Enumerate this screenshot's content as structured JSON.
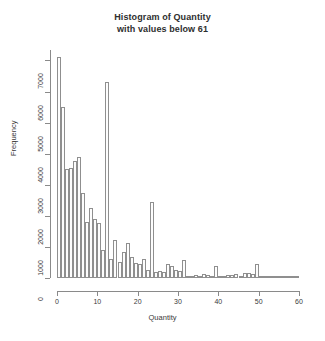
{
  "chart_data": {
    "type": "bar",
    "title": "Histogram of Quantity",
    "subtitle": "with values below 61",
    "xlabel": "Quantity",
    "ylabel": "Frequency",
    "xlim": [
      0,
      60
    ],
    "ylim": [
      0,
      7400
    ],
    "grid": false,
    "legend": null,
    "xticks": [
      0,
      10,
      20,
      30,
      40,
      50,
      60
    ],
    "yticks": [
      0,
      1000,
      2000,
      3000,
      4000,
      5000,
      6000,
      7000
    ],
    "xtick_labels": [
      "0",
      "10",
      "20",
      "30",
      "40",
      "50",
      "60"
    ],
    "ytick_labels": [
      "0",
      "1000",
      "2000",
      "3000",
      "4000",
      "5000",
      "6000",
      "7000"
    ],
    "bin_width": 1,
    "categories": [
      1,
      2,
      3,
      4,
      5,
      6,
      7,
      8,
      9,
      10,
      11,
      12,
      13,
      14,
      15,
      16,
      17,
      18,
      19,
      20,
      21,
      22,
      23,
      24,
      25,
      26,
      27,
      28,
      29,
      30,
      31,
      32,
      33,
      34,
      35,
      36,
      37,
      38,
      39,
      40,
      41,
      42,
      43,
      44,
      45,
      46,
      47,
      48,
      49,
      50,
      51,
      52,
      53,
      54,
      55,
      56,
      57,
      58,
      59,
      60
    ],
    "values": [
      7100,
      5500,
      3500,
      3550,
      3750,
      3900,
      2750,
      1800,
      2250,
      1900,
      1780,
      890,
      6300,
      600,
      1230,
      530,
      850,
      1130,
      690,
      480,
      460,
      610,
      250,
      2430,
      200,
      230,
      190,
      460,
      380,
      270,
      210,
      580,
      60,
      55,
      90,
      80,
      120,
      100,
      60,
      390,
      70,
      60,
      110,
      90,
      130,
      70,
      150,
      170,
      120,
      460,
      50,
      45,
      40,
      40,
      35,
      30,
      30,
      25,
      25,
      20
    ],
    "bar_centers": [
      1.5,
      2.5,
      3.5,
      4.5,
      5.5,
      6.5,
      7.5,
      8.5,
      9.5,
      10.5,
      11.5,
      12.5,
      13.5,
      14.5,
      15.5,
      16.5,
      17.5,
      18.5,
      19.5,
      20.5,
      21.5,
      22.5,
      23.5,
      24.5,
      25.5,
      26.5,
      27.5,
      28.5,
      29.5,
      30.5,
      31.5,
      32.5,
      33.5,
      34.5,
      35.5,
      36.5,
      37.5,
      38.5,
      39.5,
      40.5,
      41.5,
      42.5,
      43.5,
      44.5,
      45.5,
      46.5,
      47.5,
      48.5,
      49.5,
      50.5,
      51.5,
      52.5,
      53.5,
      54.5,
      55.5,
      56.5,
      57.5,
      58.5,
      59.5,
      60.5
    ],
    "bar_x_values": [
      1,
      2,
      3,
      4,
      5,
      6,
      7,
      8,
      9,
      10,
      11,
      12,
      13,
      14,
      15,
      16,
      17,
      18,
      19,
      20,
      21,
      22,
      23,
      24,
      25,
      26,
      27,
      28,
      29,
      30,
      31,
      32,
      33,
      34,
      35,
      36,
      37,
      38,
      39,
      40,
      41,
      42,
      43,
      44,
      45,
      46,
      47,
      48,
      49,
      50,
      51,
      52,
      53,
      54,
      55,
      56,
      57,
      58,
      59,
      60
    ],
    "bar_heights_ordered": [
      {
        "x": 1,
        "y": 7100
      },
      {
        "x": 2,
        "y": 5500
      },
      {
        "x": 3,
        "y": 3500
      },
      {
        "x": 4,
        "y": 3550
      },
      {
        "x": 5,
        "y": 3750
      },
      {
        "x": 6,
        "y": 3900
      },
      {
        "x": 7,
        "y": 2750
      },
      {
        "x": 8,
        "y": 1800
      },
      {
        "x": 9,
        "y": 2250
      },
      {
        "x": 10,
        "y": 1900
      },
      {
        "x": 11,
        "y": 1780
      },
      {
        "x": 12,
        "y": 890
      },
      {
        "x": 13,
        "y": 6300
      },
      {
        "x": 14,
        "y": 600
      },
      {
        "x": 15,
        "y": 1230
      },
      {
        "x": 16,
        "y": 530
      },
      {
        "x": 17,
        "y": 850
      },
      {
        "x": 18,
        "y": 1130
      },
      {
        "x": 19,
        "y": 690
      },
      {
        "x": 20,
        "y": 480
      },
      {
        "x": 21,
        "y": 460
      },
      {
        "x": 22,
        "y": 610
      },
      {
        "x": 23,
        "y": 250
      },
      {
        "x": 24,
        "y": 2430
      },
      {
        "x": 25,
        "y": 200
      },
      {
        "x": 26,
        "y": 230
      },
      {
        "x": 27,
        "y": 190
      },
      {
        "x": 28,
        "y": 460
      },
      {
        "x": 29,
        "y": 380
      },
      {
        "x": 30,
        "y": 270
      },
      {
        "x": 31,
        "y": 210
      },
      {
        "x": 32,
        "y": 580
      },
      {
        "x": 33,
        "y": 60
      },
      {
        "x": 34,
        "y": 55
      },
      {
        "x": 35,
        "y": 90
      },
      {
        "x": 36,
        "y": 80
      },
      {
        "x": 37,
        "y": 120
      },
      {
        "x": 38,
        "y": 100
      },
      {
        "x": 39,
        "y": 60
      },
      {
        "x": 40,
        "y": 390
      },
      {
        "x": 41,
        "y": 70
      },
      {
        "x": 42,
        "y": 60
      },
      {
        "x": 43,
        "y": 110
      },
      {
        "x": 44,
        "y": 90
      },
      {
        "x": 45,
        "y": 130
      },
      {
        "x": 46,
        "y": 70
      },
      {
        "x": 47,
        "y": 150
      },
      {
        "x": 48,
        "y": 170
      },
      {
        "x": 49,
        "y": 120
      },
      {
        "x": 50,
        "y": 460
      },
      {
        "x": 51,
        "y": 50
      },
      {
        "x": 52,
        "y": 45
      },
      {
        "x": 53,
        "y": 40
      },
      {
        "x": 54,
        "y": 40
      },
      {
        "x": 55,
        "y": 35
      },
      {
        "x": 56,
        "y": 30
      },
      {
        "x": 57,
        "y": 30
      },
      {
        "x": 58,
        "y": 25
      },
      {
        "x": 59,
        "y": 25
      },
      {
        "x": 60,
        "y": 20
      }
    ],
    "colors": {
      "bar_fill": "#fdfdfd",
      "bar_border": "#8f8f8f",
      "axis": "#8a8a8a",
      "text": "#3a3a3a",
      "background": "#ffffff"
    }
  }
}
